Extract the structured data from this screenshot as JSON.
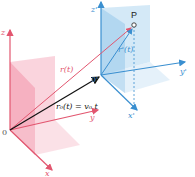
{
  "diagram": {
    "title": "",
    "frames": {
      "fixed": {
        "origin_label": "0",
        "x_label": "x",
        "y_label": "y",
        "z_label": "z",
        "color": "#e2566f",
        "plane_color": "#f2a0b1"
      },
      "moving": {
        "origin_label": "0'",
        "x_label": "x'",
        "y_label": "y'",
        "z_label": "z'",
        "color": "#3a8fd0",
        "plane_color": "#9ccbec"
      }
    },
    "point_label": "P",
    "vectors": {
      "r": "r(t)",
      "r_prime": "r'(t)",
      "r0": "r₀(t) = v₀ t"
    }
  }
}
